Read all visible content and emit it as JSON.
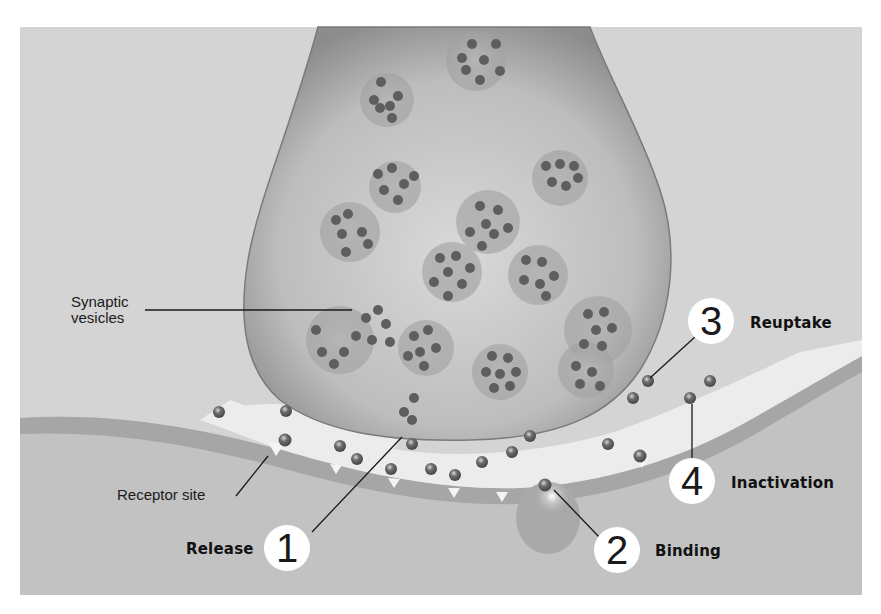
{
  "diagram": {
    "colors": {
      "background": "#d6d6d6",
      "terminal": "#bdbdbd",
      "terminal_edge": "#7a7a7a",
      "vesicle": "#a9a9a9",
      "neurotransmitter": "#6f6f6f",
      "cleft": "#ececec",
      "postsynaptic": "#b8b8b8",
      "callout_circle": "#ffffff",
      "text": "#111111"
    },
    "labels": {
      "synaptic_vesicles_line1": "Synaptic",
      "synaptic_vesicles_line2": "vesicles",
      "receptor_site": "Receptor site"
    },
    "steps": [
      {
        "number": "1",
        "label": "Release"
      },
      {
        "number": "2",
        "label": "Binding"
      },
      {
        "number": "3",
        "label": "Reuptake"
      },
      {
        "number": "4",
        "label": "Inactivation"
      }
    ],
    "structures": [
      "presynaptic-terminal",
      "synaptic-vesicles",
      "synaptic-cleft",
      "postsynaptic-membrane",
      "receptor-sites",
      "neurotransmitter-molecules"
    ]
  }
}
